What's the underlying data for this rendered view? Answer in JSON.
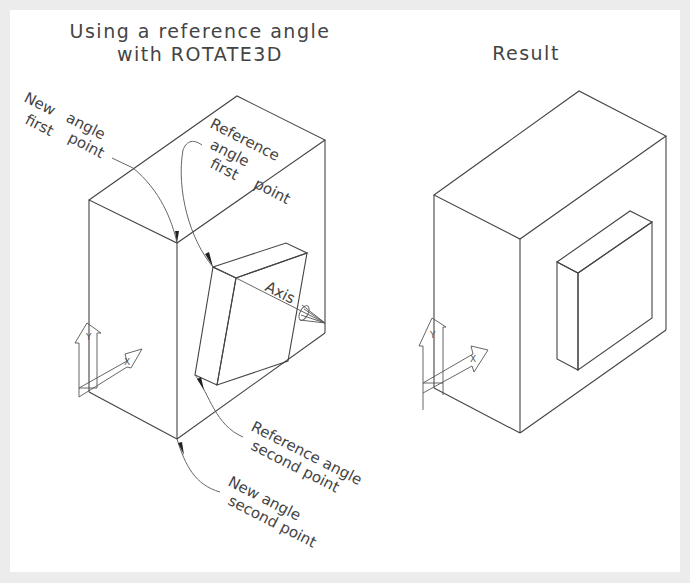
{
  "left_figure": {
    "title_line1": "Using a reference angle",
    "title_line2": "with ROTATE3D",
    "labels": {
      "new_angle_first_point": [
        "New",
        "angle",
        "first",
        "point"
      ],
      "reference_angle_first_point": [
        "Reference",
        "angle",
        "first",
        "point"
      ],
      "axis": "Axis",
      "reference_angle_second_point": [
        "Reference angle",
        "second point"
      ],
      "new_angle_second_point": [
        "New angle",
        "second point"
      ]
    },
    "ucs": {
      "x_label": "X",
      "y_label": "Y"
    }
  },
  "right_figure": {
    "title": "Result",
    "ucs": {
      "x_label": "X",
      "y_label": "Y"
    }
  },
  "colors": {
    "background": "#ececec",
    "panel": "#ffffff",
    "line": "#444444"
  }
}
